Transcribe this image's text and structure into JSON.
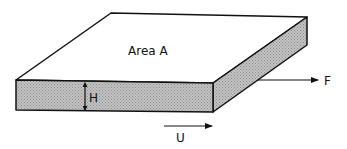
{
  "diagram": {
    "labels": {
      "area": "Area A",
      "height": "H",
      "force": "F",
      "velocity": "U"
    },
    "colors": {
      "stroke": "#111111",
      "top_face": "#ffffff",
      "side_fill": "#b8b8b8"
    }
  }
}
